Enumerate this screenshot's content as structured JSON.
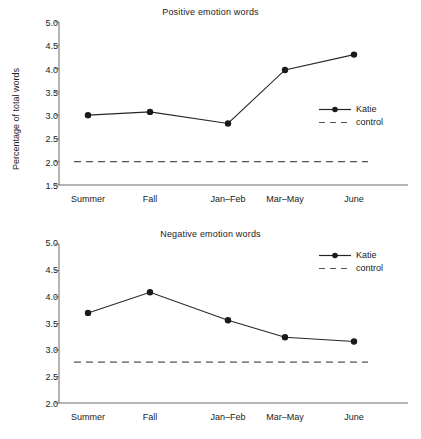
{
  "chart_data": [
    {
      "type": "line",
      "title": "Positive emotion words",
      "xlabel": "",
      "ylabel": "Percentage of total words",
      "categories": [
        "Summer",
        "Fall",
        "Jan–Feb",
        "Mar–May",
        "June"
      ],
      "yticks": [
        "1.5",
        "2.0",
        "2.5",
        "3.0",
        "3.5",
        "4.0",
        "4.5",
        "5.0"
      ],
      "ylim": [
        1.5,
        5.0
      ],
      "grid": false,
      "legend_position": "center-right",
      "series": [
        {
          "name": "Katie",
          "style": "solid-marker",
          "values": [
            3.0,
            3.07,
            2.82,
            3.97,
            4.3
          ]
        },
        {
          "name": "control",
          "style": "dashed",
          "constant": 2.0
        }
      ]
    },
    {
      "type": "line",
      "title": "Negative emotion words",
      "xlabel": "",
      "ylabel": "Percentage of total words",
      "categories": [
        "Summer",
        "Fall",
        "Jan–Feb",
        "Mar–May",
        "June"
      ],
      "yticks": [
        "2.0",
        "2.5",
        "3.0",
        "3.5",
        "4.0",
        "4.5",
        "5.0"
      ],
      "ylim": [
        2.0,
        5.0
      ],
      "grid": false,
      "legend_position": "top-right",
      "series": [
        {
          "name": "Katie",
          "style": "solid-marker",
          "values": [
            3.7,
            4.09,
            3.56,
            3.24,
            3.16
          ]
        },
        {
          "name": "control",
          "style": "dashed",
          "constant": 2.77
        }
      ]
    }
  ],
  "colors": {
    "line": "#262626",
    "axis": "#6b6b6b",
    "text": "#1a1a1a",
    "background": "#ffffff"
  }
}
